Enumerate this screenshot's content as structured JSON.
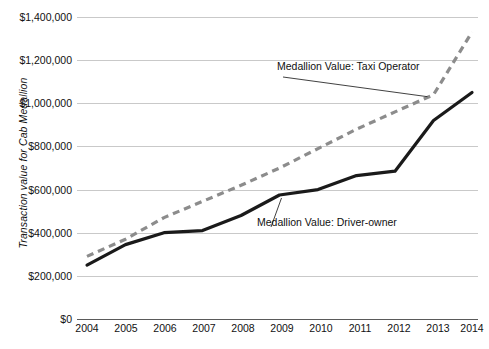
{
  "chart_data": {
    "type": "line",
    "title": "",
    "xlabel": "",
    "ylabel": "Transaction value for Cab Medallion",
    "x": [
      2004,
      2005,
      2006,
      2007,
      2008,
      2009,
      2010,
      2011,
      2012,
      2013,
      2014
    ],
    "xtick_labels": [
      "2004",
      "2005",
      "2006",
      "2007",
      "2008",
      "2009",
      "2010",
      "2011",
      "2012",
      "2013",
      "2014"
    ],
    "ytick_labels": [
      "$0",
      "$200,000",
      "$400,000",
      "$600,000",
      "$800,000",
      "$1,000,000",
      "$1,200,000",
      "$1,400,000"
    ],
    "ytick_values": [
      0,
      200000,
      400000,
      600000,
      800000,
      1000000,
      1200000,
      1400000
    ],
    "ylim": [
      0,
      1400000
    ],
    "xlim": [
      2004,
      2014
    ],
    "grid": true,
    "legend_position": "inline-annotations",
    "series": [
      {
        "name": "Medallion Value: Taxi Operator",
        "style": "dashed",
        "color": "#8c8c8c",
        "values": [
          290000,
          370000,
          470000,
          545000,
          620000,
          700000,
          790000,
          880000,
          960000,
          1040000,
          1330000
        ]
      },
      {
        "name": "Medallion Value: Driver-owner",
        "style": "solid",
        "color": "#1a1a1a",
        "values": [
          250000,
          345000,
          400000,
          410000,
          480000,
          575000,
          600000,
          665000,
          685000,
          920000,
          1050000
        ]
      }
    ],
    "annotations": [
      {
        "text": "Medallion Value: Taxi Operator",
        "series": "Medallion Value: Taxi Operator"
      },
      {
        "text": "Medallion Value: Driver-owner",
        "series": "Medallion Value: Driver-owner"
      }
    ]
  }
}
